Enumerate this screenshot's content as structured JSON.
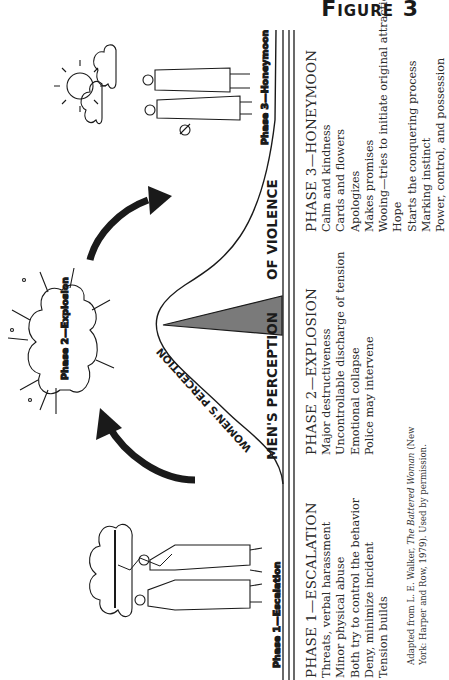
{
  "figure": {
    "title": "Figure 3"
  },
  "diagram": {
    "axis_labels": {
      "mens_perception": "MEN'S PERCEPTION",
      "of_violence": "OF VIOLENCE",
      "womens_perception": "WOMEN'S PERCEPTION"
    },
    "illustrations": [
      {
        "name": "phase-1-escalation-illustration",
        "caption": "Phase 1—Escalation",
        "description": "couple arguing under storm cloud with lightning"
      },
      {
        "name": "phase-2-explosion-illustration",
        "caption": "Phase 2—Explosion",
        "description": "explosion burst cloud"
      },
      {
        "name": "phase-3-honeymoon-illustration",
        "caption": "Phase 3—Honeymoon",
        "description": "couple with flowers under sun and clouds"
      }
    ],
    "colors": {
      "line": "#1a1a1a",
      "triangle_fill": "#7a7a7a",
      "arrow": "#1a1a1a",
      "text": "#2a2a2a"
    }
  },
  "phases": [
    {
      "title": "PHASE 1—ESCALATION",
      "items": [
        "Threats, verbal harassment",
        "Minor physical abuse",
        "Both try to control the behavior",
        "Deny, minimize incident",
        "Tension builds"
      ]
    },
    {
      "title": "PHASE 2—EXPLOSION",
      "items": [
        "Major destructiveness",
        "Uncontrollable discharge of tension",
        "Emotional collapse",
        "Police may intervene"
      ]
    },
    {
      "title": "PHASE 3—HONEYMOON",
      "items": [
        "Calm and kindness",
        "Cards and flowers",
        "Apologizes",
        "Makes promises",
        "Wooing—tries to initiate original attraction",
        "Hope",
        "Starts the conquering process",
        "Marking instinct",
        "Power, control, and possession"
      ]
    }
  ],
  "credit": {
    "prefix": "Adapted from L. E. Walker, ",
    "book_title": "The Battered Woman",
    "suffix_line1": " (New",
    "line2": "York: Harper and Row, 1979). Used by permission."
  }
}
